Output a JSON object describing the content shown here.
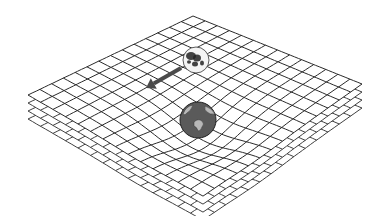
{
  "figure": {
    "grid": {
      "rows": 14,
      "cols": 14,
      "corners": {
        "top": [
          193,
          16
        ],
        "left": [
          28,
          95
        ],
        "right": [
          362,
          84
        ],
        "bottom": [
          203,
          196
        ]
      },
      "layers": 4,
      "layer_offset": 8,
      "line_color": "#2a2a2a",
      "dip_center": [
        198,
        130
      ],
      "dip_depth": 14,
      "dip_radius": 55
    },
    "earth": {
      "cx": 198,
      "cy": 120,
      "r": 18,
      "fill": "#5a5a5a",
      "land_fill": "#b8b8b8",
      "stroke": "#222222"
    },
    "moon": {
      "cx": 196,
      "cy": 60,
      "r": 13,
      "fill": "#f4f4f4",
      "spot_fill": "#222222",
      "stroke": "#333333"
    },
    "arrow": {
      "from": [
        181,
        68
      ],
      "to": [
        146,
        88
      ],
      "color": "#4a4a4a"
    }
  }
}
